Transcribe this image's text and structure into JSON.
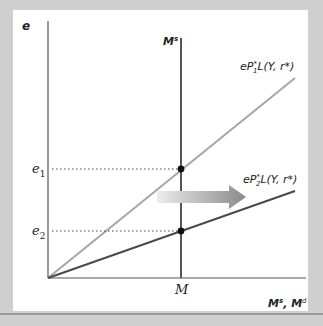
{
  "diagram": {
    "y_axis_label": "e",
    "x_axis_label": "Ms, Md",
    "x_axis_label_parts": {
      "M1": "M",
      "s": "s",
      "sep": ", ",
      "M2": "M",
      "d": "d"
    },
    "money_supply_label": {
      "base": "M",
      "sup": "s"
    },
    "supply_quantity_tick": "M",
    "exchange_rate_ticks": [
      {
        "base": "e",
        "sub": "1"
      },
      {
        "base": "e",
        "sub": "2"
      }
    ],
    "curves": [
      {
        "id": "demand-1",
        "label": "eP*1L(Y, r*)",
        "prefix": "eP",
        "star": "*",
        "sub": "1",
        "suffix": "L(Y, r*)",
        "color": "#a6a6a6"
      },
      {
        "id": "demand-2",
        "label": "eP*2L(Y, r*)",
        "prefix": "eP",
        "star": "*",
        "sub": "2",
        "suffix": "L(Y, r*)",
        "color": "#4a4a4a"
      }
    ],
    "shift_arrow": {
      "direction": "right",
      "from_color": "#e6e6e6",
      "to_color": "#8c8c8c"
    },
    "colors": {
      "background": "#cfcfcf",
      "panel": "#ffffff",
      "axis": "#555555",
      "supply_line": "#555555",
      "point": "#111111"
    }
  }
}
